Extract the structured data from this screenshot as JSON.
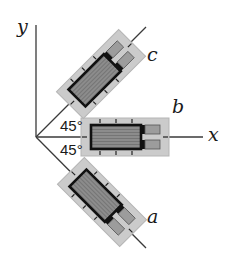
{
  "diagram": {
    "type": "strain-gauge-rosette-45deg",
    "axes": {
      "x_label": "x",
      "y_label": "y"
    },
    "angles": {
      "upper": "45°",
      "lower": "45°"
    },
    "gauges": [
      {
        "id": "c",
        "label": "c",
        "angle_deg": 45
      },
      {
        "id": "b",
        "label": "b",
        "angle_deg": 0
      },
      {
        "id": "a",
        "label": "a",
        "angle_deg": -45
      }
    ],
    "colors": {
      "line": "#3a3a3a",
      "backing": "#c8c8c8",
      "grid_fill": "#8a8a8a",
      "grid_border": "#111111",
      "tab_fill": "#9a9a9a"
    }
  }
}
